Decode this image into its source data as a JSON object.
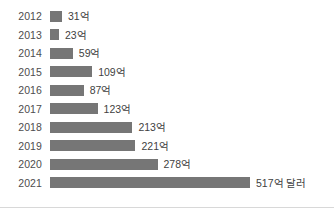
{
  "chart_data": {
    "type": "bar",
    "orientation": "horizontal",
    "title": "",
    "subtitle": "",
    "xlabel": "",
    "ylabel": "",
    "unit_label": "억 달러",
    "categories": [
      "2012",
      "2013",
      "2014",
      "2015",
      "2016",
      "2017",
      "2018",
      "2019",
      "2020",
      "2021"
    ],
    "values": [
      31,
      23,
      59,
      109,
      87,
      123,
      213,
      221,
      278,
      517
    ],
    "value_labels": [
      "31억",
      "23억",
      "59억",
      "109억",
      "87억",
      "123억",
      "213억",
      "221억",
      "278억",
      "517억 달러"
    ],
    "xlim": [
      0,
      517
    ],
    "grid": false,
    "legend": false,
    "bar_color": "#767676",
    "label_color": "#3f3f3f",
    "axis_label_color": "#4d4d4d",
    "background_color": "#ffffff",
    "rule_color": "#d8d8d8"
  },
  "rows": [
    {
      "year": "2012",
      "value": 31,
      "value_label": "31억"
    },
    {
      "year": "2013",
      "value": 23,
      "value_label": "23억"
    },
    {
      "year": "2014",
      "value": 59,
      "value_label": "59억"
    },
    {
      "year": "2015",
      "value": 109,
      "value_label": "109억"
    },
    {
      "year": "2016",
      "value": 87,
      "value_label": "87억"
    },
    {
      "year": "2017",
      "value": 123,
      "value_label": "123억"
    },
    {
      "year": "2018",
      "value": 213,
      "value_label": "213억"
    },
    {
      "year": "2019",
      "value": 221,
      "value_label": "221억"
    },
    {
      "year": "2020",
      "value": 278,
      "value_label": "278억"
    },
    {
      "year": "2021",
      "value": 517,
      "value_label": "517억 달러"
    }
  ]
}
